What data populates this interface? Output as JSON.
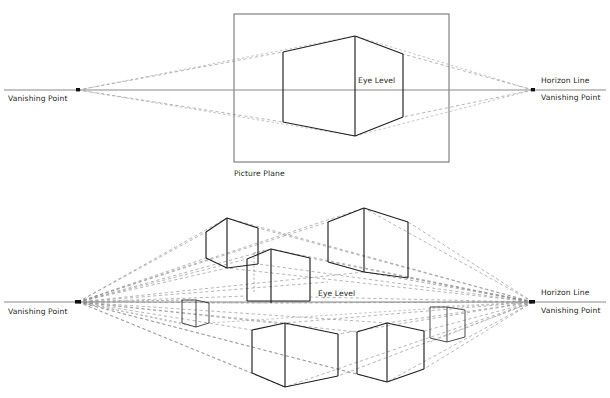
{
  "figure": {
    "title_hidden": "",
    "type": "two-point-perspective-construction-diagram",
    "background_color": "#ffffff",
    "ink_color": "#231f20",
    "construction_line_color": "#777777",
    "horizon_line_color": "#8a8a8a"
  },
  "top_panel": {
    "name": "single-cube-on-picture-plane",
    "labels": {
      "vanishing_point_left": "Vanishing Point",
      "vanishing_point_right": "Vanishing Point",
      "horizon_line": "Horizon Line",
      "eye_level": "Eye Level",
      "picture_plane": "Picture Plane"
    },
    "horizon_y": 90,
    "vanishing_points": [
      {
        "id": "VPL",
        "x": 78,
        "y": 90
      },
      {
        "id": "VPR",
        "x": 533,
        "y": 90
      }
    ],
    "picture_plane_rect": {
      "x": 234,
      "y": 14,
      "width": 215,
      "height": 148
    },
    "cube": {
      "front_edge_x": 355,
      "front_top_y": 36,
      "front_bottom_y": 136,
      "left_edge_x": 283,
      "left_top_y": 52,
      "left_bottom_y": 122,
      "right_edge_x": 403,
      "right_top_y": 54,
      "right_bottom_y": 117
    }
  },
  "bottom_panel": {
    "name": "multiple-cubes-two-point-perspective",
    "labels": {
      "vanishing_point_left": "Vanishing Point",
      "vanishing_point_right": "Vanishing Point",
      "horizon_line": "Horizon Line",
      "eye_level": "Eye Level"
    },
    "horizon_y": 302,
    "vanishing_points": [
      {
        "id": "VPL",
        "x": 78,
        "y": 302
      },
      {
        "id": "VPR",
        "x": 533,
        "y": 302
      }
    ],
    "cube_count": 7,
    "cubes": [
      {
        "id": "cube-upper-left",
        "front_x": 227,
        "top_y": 218,
        "bottom_y": 268,
        "left_x": 206,
        "right_x": 258
      },
      {
        "id": "cube-center",
        "front_x": 271,
        "top_y": 249,
        "bottom_y": 303,
        "left_x": 247,
        "right_x": 310
      },
      {
        "id": "cube-upper-right-large",
        "front_x": 364,
        "top_y": 208,
        "bottom_y": 272,
        "left_x": 328,
        "right_x": 408
      },
      {
        "id": "cube-small-left",
        "front_x": 196,
        "top_y": 300,
        "bottom_y": 323,
        "left_x": 182,
        "right_x": 209
      },
      {
        "id": "cube-small-right",
        "front_x": 447,
        "top_y": 307,
        "bottom_y": 342,
        "left_x": 430,
        "right_x": 465
      },
      {
        "id": "cube-lower-left-large",
        "front_x": 285,
        "top_y": 323,
        "bottom_y": 387,
        "left_x": 252,
        "right_x": 338
      },
      {
        "id": "cube-lower-right",
        "front_x": 387,
        "top_y": 323,
        "bottom_y": 382,
        "left_x": 357,
        "right_x": 424
      }
    ]
  }
}
